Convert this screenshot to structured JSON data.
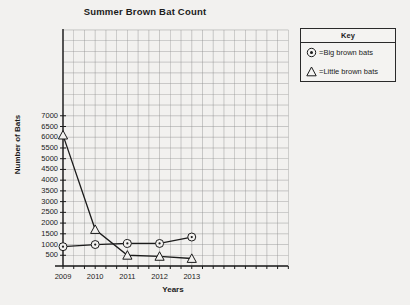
{
  "chart_data": {
    "type": "line",
    "title": "Summer Brown Bat Count",
    "xlabel": "Years",
    "ylabel": "Number of Bats",
    "categories": [
      "2009",
      "2010",
      "2011",
      "2012",
      "2013"
    ],
    "series": [
      {
        "name": "Big brown bats",
        "marker": "circle-dot",
        "values": [
          900,
          1000,
          1050,
          1050,
          1350
        ]
      },
      {
        "name": "Little brown bats",
        "marker": "triangle",
        "values": [
          6100,
          1700,
          500,
          450,
          350
        ]
      }
    ],
    "ylim": [
      0,
      7500
    ],
    "yticks": [
      500,
      1000,
      1500,
      2000,
      2500,
      3000,
      3500,
      4000,
      4500,
      5000,
      5500,
      6000,
      6500,
      7000
    ],
    "ytick_labels": [
      "500",
      "1000",
      "1500",
      "2000",
      "2500",
      "3000",
      "3500",
      "4000",
      "4500",
      "5000",
      "5500",
      "6000",
      "6500",
      "7000"
    ],
    "xtick_labels": [
      "2009",
      "2010",
      "2011",
      "2012",
      "2013"
    ],
    "grid": true,
    "legend_position": "right-outside",
    "colors": {
      "line": "#1b1b1b",
      "grid": "#8d8d8d",
      "axis": "#1b1b1b",
      "background": "#f2f1ef"
    }
  },
  "legend": {
    "title": "Key",
    "entries": [
      {
        "marker": "circle-dot-icon",
        "label": "=Big brown bats"
      },
      {
        "marker": "triangle-icon",
        "label": "=Little brown bats"
      }
    ]
  }
}
